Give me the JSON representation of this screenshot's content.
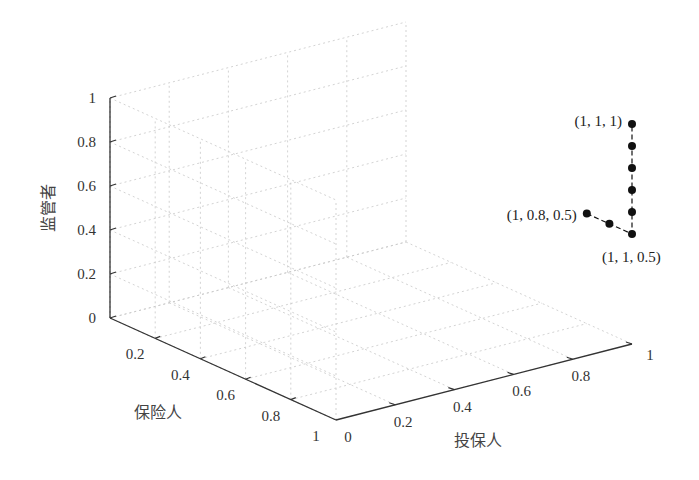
{
  "chart_data": {
    "type": "scatter",
    "subtype": "3d-line-scatter",
    "title": "",
    "axes": {
      "x": {
        "label": "投保人",
        "ticks": [
          "0",
          "0.2",
          "0.4",
          "0.6",
          "0.8",
          "1"
        ],
        "range": [
          0,
          1
        ]
      },
      "y": {
        "label": "保险人",
        "ticks": [
          "0.2",
          "0.4",
          "0.6",
          "0.8",
          "1"
        ],
        "range": [
          0,
          1
        ]
      },
      "z": {
        "label": "监管者",
        "ticks": [
          "0",
          "0.2",
          "0.4",
          "0.6",
          "0.8",
          "1"
        ],
        "range": [
          0,
          1
        ]
      }
    },
    "grid": true,
    "series": [
      {
        "name": "trajectory",
        "style": "dashed line with filled circle markers",
        "color": "#111111",
        "points": [
          {
            "x": 1,
            "y": 0.8,
            "z": 0.5
          },
          {
            "x": 1,
            "y": 0.9,
            "z": 0.5
          },
          {
            "x": 1,
            "y": 1,
            "z": 0.5
          },
          {
            "x": 1,
            "y": 1,
            "z": 0.6
          },
          {
            "x": 1,
            "y": 1,
            "z": 0.7
          },
          {
            "x": 1,
            "y": 1,
            "z": 0.8
          },
          {
            "x": 1,
            "y": 1,
            "z": 0.9
          },
          {
            "x": 1,
            "y": 1,
            "z": 1
          }
        ]
      }
    ],
    "annotations": [
      {
        "text": "(1, 1, 1)",
        "at": {
          "x": 1,
          "y": 1,
          "z": 1
        }
      },
      {
        "text": "(1, 0.8, 0.5)",
        "at": {
          "x": 1,
          "y": 0.8,
          "z": 0.5
        }
      },
      {
        "text": "(1, 1, 0.5)",
        "at": {
          "x": 1,
          "y": 1,
          "z": 0.5
        }
      }
    ],
    "legend": null
  }
}
